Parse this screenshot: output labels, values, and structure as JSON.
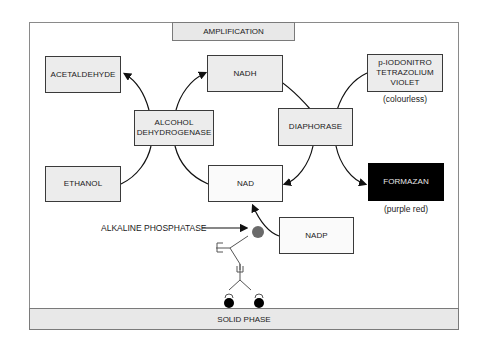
{
  "diagram": {
    "header_band": {
      "label": "AMPLIFICATION"
    },
    "footer_band": {
      "label": "SOLID PHASE"
    },
    "nodes": {
      "acetaldehyde": {
        "label": "ACETALDEHYDE"
      },
      "nadh": {
        "label": "NADH"
      },
      "alcohol_dehydrogenase": {
        "line1": "ALCOHOL",
        "line2": "DEHYDROGENASE"
      },
      "ethanol": {
        "label": "ETHANOL"
      },
      "nad": {
        "label": "NAD"
      },
      "diaphorase": {
        "label": "DIAPHORASE"
      },
      "pint_violet": {
        "line1": "p-IODONITRO",
        "line2": "TETRAZOLIUM",
        "line3": "VIOLET"
      },
      "formazan": {
        "label": "FORMAZAN"
      },
      "nadp": {
        "label": "NADP"
      }
    },
    "captions": {
      "colourless": "(colourless)",
      "purple_red": "(purple red)"
    },
    "labels": {
      "alkaline_phosphatase": "ALKALINE PHOSPHATASE"
    },
    "colors": {
      "box_fill": "#ececec",
      "box_border": "#3a3a3a",
      "formazan_fill": "#000000",
      "enzyme_dot": "#6a6a6a",
      "antigen_dot": "#000000"
    },
    "edges": [
      {
        "from": "alcohol_dehydrogenase",
        "to": "acetaldehyde"
      },
      {
        "from": "alcohol_dehydrogenase",
        "to": "nadh"
      },
      {
        "from": "ethanol",
        "to": "alcohol_dehydrogenase"
      },
      {
        "from": "nad",
        "to": "alcohol_dehydrogenase"
      },
      {
        "from": "nadh",
        "to": "diaphorase"
      },
      {
        "from": "pint_violet",
        "to": "diaphorase"
      },
      {
        "from": "diaphorase",
        "to": "nad"
      },
      {
        "from": "diaphorase",
        "to": "formazan"
      },
      {
        "from": "nadp",
        "to": "nad",
        "via": "alkaline_phosphatase"
      }
    ]
  }
}
